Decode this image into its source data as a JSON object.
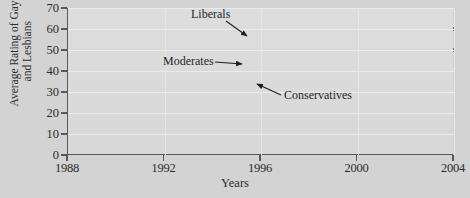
{
  "chart_data": {
    "type": "line",
    "title": "",
    "xlabel": "Years",
    "ylabel": "Average Rating of Gays\nand Lesbians",
    "x": [
      1988,
      1992,
      1996,
      2000,
      2004
    ],
    "xticklabels": [
      "1988",
      "1992",
      "1996",
      "2000",
      "2004"
    ],
    "yticklabels": [
      "0",
      "10",
      "20",
      "30",
      "40",
      "50",
      "60",
      "70"
    ],
    "yticks": [
      0,
      10,
      20,
      30,
      40,
      50,
      60,
      70
    ],
    "ylim": [
      0,
      70
    ],
    "xlim": [
      1988,
      2004
    ],
    "grid": true,
    "legend_position": "inline-annotations",
    "series": [
      {
        "name": "Liberals",
        "color": "#6e6e70",
        "values": [
          38,
          55,
          56.5,
          58,
          60
        ]
      },
      {
        "name": "Moderates",
        "color": "#6e6e70",
        "values": [
          32,
          39,
          42,
          46,
          50
        ]
      },
      {
        "name": "Conservatives",
        "color": "#c9c9c9",
        "values": [
          24.5,
          30,
          34,
          38.5,
          43
        ]
      }
    ],
    "annotations": [
      {
        "text": "Liberals",
        "target_series": "Liberals"
      },
      {
        "text": "Moderates",
        "target_series": "Moderates"
      },
      {
        "text": "Conservatives",
        "target_series": "Conservatives"
      }
    ]
  },
  "axes": {
    "y_title_line1": "Average Rating of Gays",
    "y_title_line2": "and Lesbians",
    "x_title": "Years"
  },
  "colors": {
    "page_background": "#d3d3d3",
    "plot_background": "#dcdcdc",
    "axis": "#57575a",
    "gridline": "#ebebeb",
    "dark_series": "#6e6e70",
    "light_series": "#c9c9c9",
    "text": "#2b2b2b"
  }
}
